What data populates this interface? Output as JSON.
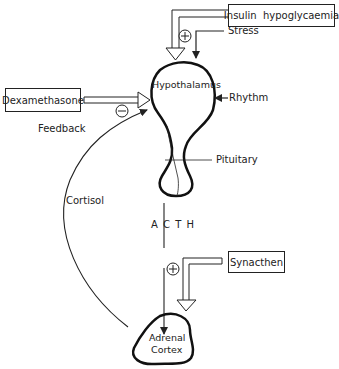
{
  "diagram": {
    "inputs": {
      "insulin": "Insulin  hypoglycaemia",
      "stress": "Stress",
      "dexamethasone": "Dexamethasone",
      "rhythm": "Rhythm",
      "synacthen": "Synacthen"
    },
    "organs": {
      "hypothalamus": "Hypothalamus",
      "pituitary": "Pituitary",
      "adrenal_line1": "Adrenal",
      "adrenal_line2": "Cortex"
    },
    "hormones": {
      "acth": "A C T H",
      "cortisol": "Cortisol"
    },
    "labels": {
      "feedback": "Feedback"
    },
    "signs": {
      "plus_top": "+",
      "minus": "−",
      "plus_bottom": "+"
    }
  }
}
